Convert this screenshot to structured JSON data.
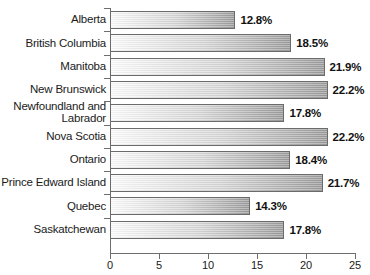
{
  "chart_data": {
    "type": "bar",
    "orientation": "horizontal",
    "title": "",
    "subtitle": "",
    "xlabel": "",
    "ylabel": "",
    "xlim": [
      0,
      25
    ],
    "xticks": [
      0,
      5,
      10,
      15,
      20,
      25
    ],
    "xtick_labels": [
      "0",
      "5",
      "10",
      "15",
      "20",
      "25"
    ],
    "grid": false,
    "legend": null,
    "value_suffix": "%",
    "categories": [
      "Alberta",
      "British Columbia",
      "Manitoba",
      "New Brunswick",
      "Newfoundland and\nLabrador",
      "Nova Scotia",
      "Ontario",
      "Prince Edward Island",
      "Quebec",
      "Saskatchewan"
    ],
    "values": [
      12.8,
      18.5,
      21.9,
      22.2,
      17.8,
      22.2,
      18.4,
      21.7,
      14.3,
      17.8
    ],
    "data_labels": [
      "12.8%",
      "18.5%",
      "21.9%",
      "22.2%",
      "17.8%",
      "22.2%",
      "18.4%",
      "21.7%",
      "14.3%",
      "17.8%"
    ],
    "colors": {
      "bar_gradient_start": "#fdfdfd",
      "bar_gradient_end": "#9d9d9d",
      "bar_border": "#6b6b6b",
      "axis": "#6e6e6e",
      "text": "#1a1a1a",
      "background": "#ffffff"
    }
  }
}
